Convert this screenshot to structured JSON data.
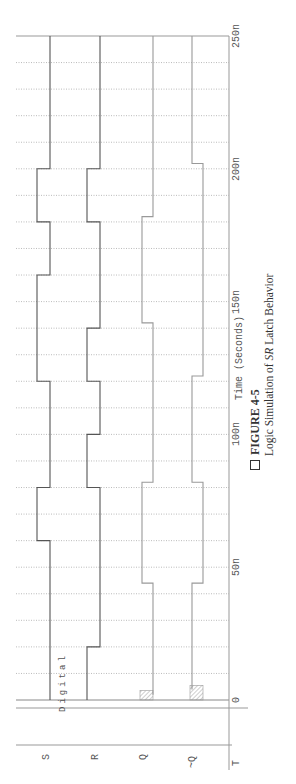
{
  "figure": {
    "number": "FIGURE 4-5",
    "caption_prefix": "Logic Simulation of ",
    "caption_italic": "SR",
    "caption_suffix": " Latch Behavior"
  },
  "chart_data": {
    "type": "line",
    "subtype": "digital-timing-diagram",
    "orientation": "rotated 90deg counter-clockwise (time increases upward)",
    "title": "Logic Simulation of SR Latch Behavior",
    "xlabel": "Time (Seconds)",
    "ylabel": "",
    "plot_tag": "Digital",
    "x_range": [
      0,
      250
    ],
    "x_unit": "ns",
    "x_ticks": [
      {
        "value": 0,
        "label": "0"
      },
      {
        "value": 50,
        "label": "50n"
      },
      {
        "value": 100,
        "label": "100n"
      },
      {
        "value": 150,
        "label": "150n"
      },
      {
        "value": 200,
        "label": "200n"
      },
      {
        "value": 250,
        "label": "250n"
      }
    ],
    "grid": {
      "on": true,
      "major_step": 10,
      "style": "dotted"
    },
    "axis_end_label": "T",
    "series": [
      {
        "name": "S",
        "segments": [
          [
            0,
            60,
            0
          ],
          [
            60,
            80,
            1
          ],
          [
            80,
            120,
            0
          ],
          [
            120,
            160,
            1
          ],
          [
            160,
            180,
            0
          ],
          [
            180,
            200,
            1
          ],
          [
            200,
            250,
            0
          ]
        ]
      },
      {
        "name": "R",
        "segments": [
          [
            0,
            20,
            1
          ],
          [
            20,
            80,
            0
          ],
          [
            80,
            100,
            1
          ],
          [
            100,
            120,
            0
          ],
          [
            120,
            140,
            1
          ],
          [
            140,
            180,
            0
          ],
          [
            180,
            200,
            1
          ],
          [
            200,
            250,
            0
          ]
        ]
      },
      {
        "name": "Q",
        "unknown": [
          0,
          2
        ],
        "segments": [
          [
            2,
            44,
            0
          ],
          [
            44,
            82,
            1
          ],
          [
            82,
            142,
            0
          ],
          [
            142,
            182,
            1
          ],
          [
            182,
            250,
            0
          ]
        ]
      },
      {
        "name": "~Q",
        "unknown": [
          0,
          4
        ],
        "segments": [
          [
            4,
            44,
            1
          ],
          [
            44,
            82,
            0
          ],
          [
            82,
            122,
            1
          ],
          [
            122,
            202,
            0
          ],
          [
            202,
            250,
            1
          ]
        ]
      }
    ],
    "colors": {
      "S": "#555555",
      "R": "#555555",
      "Q": "#999999",
      "~Q": "#999999",
      "grid": "#aaaaaa",
      "axis": "#888888"
    }
  }
}
